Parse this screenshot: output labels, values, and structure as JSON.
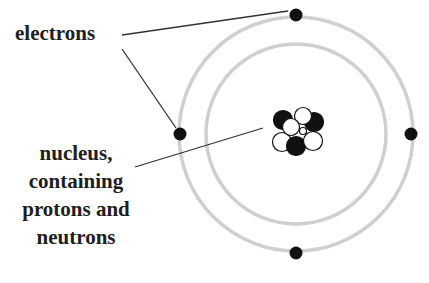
{
  "diagram": {
    "labels": {
      "electrons": "electrons",
      "nucleus_lines": [
        "nucleus,",
        "containing",
        "protons and",
        "neutrons"
      ]
    },
    "orbits": [
      {
        "name": "inner-orbit",
        "electrons": 2
      },
      {
        "name": "outer-orbit",
        "electrons": 4
      }
    ],
    "nucleus": {
      "protons": 4,
      "neutrons": 4
    },
    "colors": {
      "orbit": "#cfcfcf",
      "electron": "#111111",
      "leader_line": "#333333",
      "proton": "#111111",
      "neutron": "#ffffff",
      "text": "#1e1e1e"
    }
  }
}
